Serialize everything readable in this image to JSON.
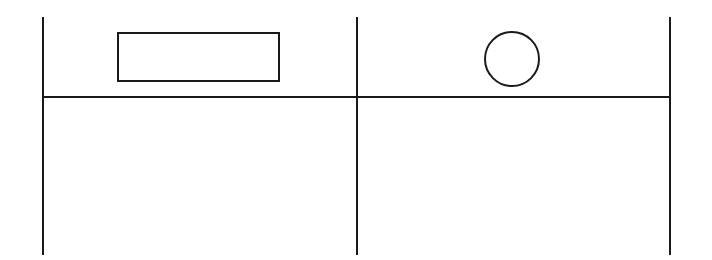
{
  "diagram": {
    "background": "#ffffff",
    "stroke_color": "#1a1a1a",
    "stroke_width": 2,
    "vertical_lines": [
      {
        "x": 43,
        "y1": 17,
        "y2": 255
      },
      {
        "x": 357,
        "y1": 17,
        "y2": 255
      },
      {
        "x": 670,
        "y1": 17,
        "y2": 255
      }
    ],
    "horizontal_line": {
      "x1": 43,
      "x2": 670,
      "y": 97
    },
    "rectangle": {
      "x": 118,
      "y": 33,
      "width": 161,
      "height": 48
    },
    "circle": {
      "cx": 512,
      "cy": 59,
      "r": 27
    }
  }
}
